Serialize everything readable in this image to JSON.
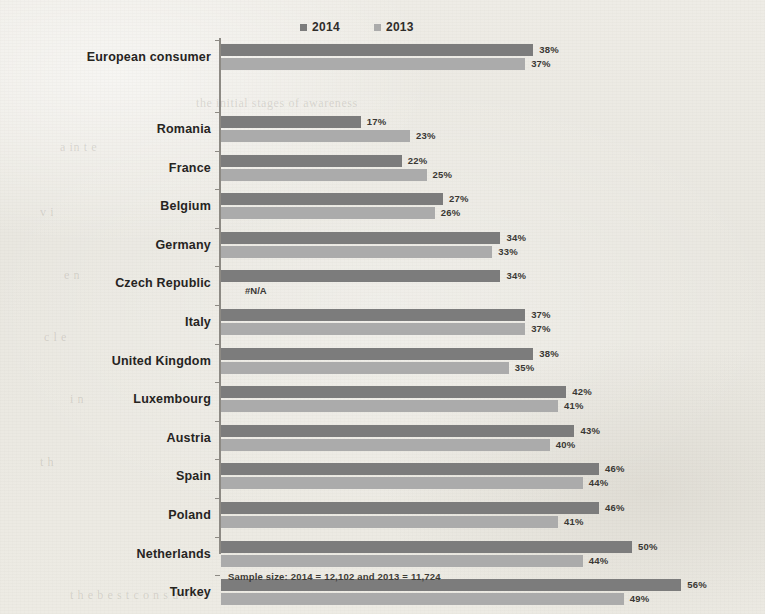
{
  "legend": {
    "items": [
      {
        "label": "2014",
        "color": "#7c7c7c"
      },
      {
        "label": "2013",
        "color": "#ababab"
      }
    ]
  },
  "footnote": "Sample size: 2014 = 12,102 and 2013 = 11,724",
  "na_marker": "#N/A",
  "chart_data": {
    "type": "bar",
    "orientation": "horizontal",
    "title": "",
    "xlabel": "",
    "ylabel": "",
    "xlim": [
      0,
      60
    ],
    "grid": false,
    "legend_position": "top",
    "categories": [
      "European consumer",
      "Romania",
      "France",
      "Belgium",
      "Germany",
      "Czech Republic",
      "Italy",
      "United Kingdom",
      "Luxembourg",
      "Austria",
      "Spain",
      "Poland",
      "Netherlands",
      "Turkey"
    ],
    "series": [
      {
        "name": "2014",
        "color": "#7c7c7c",
        "values": [
          38,
          17,
          22,
          27,
          34,
          34,
          37,
          38,
          42,
          43,
          46,
          46,
          50,
          56
        ],
        "labels": [
          "38%",
          "17%",
          "22%",
          "27%",
          "34%",
          "34%",
          "37%",
          "38%",
          "42%",
          "43%",
          "46%",
          "46%",
          "50%",
          "56%"
        ]
      },
      {
        "name": "2013",
        "color": "#ababab",
        "values": [
          37,
          23,
          25,
          26,
          33,
          null,
          37,
          35,
          41,
          40,
          44,
          41,
          44,
          49
        ],
        "labels": [
          "37%",
          "23%",
          "25%",
          "26%",
          "33%",
          "#N/A",
          "37%",
          "35%",
          "41%",
          "40%",
          "44%",
          "41%",
          "44%",
          "49%"
        ]
      }
    ]
  },
  "ghost_text": [
    {
      "text": "the initial stages of awareness",
      "x": 196,
      "y": 96
    },
    {
      "text": "a  in  t  e",
      "x": 60,
      "y": 140
    },
    {
      "text": "v   i",
      "x": 40,
      "y": 205
    },
    {
      "text": "e   n",
      "x": 64,
      "y": 268
    },
    {
      "text": "c  l    e",
      "x": 44,
      "y": 330
    },
    {
      "text": "i   n",
      "x": 70,
      "y": 392
    },
    {
      "text": "t   h",
      "x": 40,
      "y": 455
    },
    {
      "text": "t h e   b e s t   c o n s u m e r",
      "x": 70,
      "y": 588
    }
  ]
}
